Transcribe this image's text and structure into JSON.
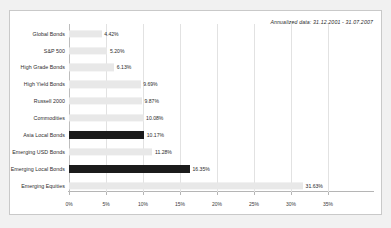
{
  "annotation": "Annualized data: 31.12.2001 - 31.07.2007",
  "colors": {
    "bar_default": "#e8e8e8",
    "bar_highlight": "#1b1b1b",
    "panel_background": "#ffffff",
    "page_background": "#f1f1f1",
    "text": "#2b2b2b",
    "gridline": "#e2e2e2"
  },
  "chart_data": {
    "type": "bar",
    "orientation": "horizontal",
    "title": "",
    "subtitle": "",
    "xlabel": "",
    "ylabel": "",
    "xlim": [
      0,
      35
    ],
    "grid": true,
    "legend": "none",
    "xticks": [
      0,
      5,
      10,
      15,
      20,
      25,
      30,
      35
    ],
    "xtick_labels": [
      "0%",
      "5%",
      "10%",
      "15%",
      "20%",
      "25%",
      "30%",
      "35%"
    ],
    "categories": [
      "Global Bonds",
      "S&P 500",
      "High Grade Bonds",
      "High Yield Bonds",
      "Russell 2000",
      "Commodities",
      "Asia Local Bonds",
      "Emerging USD Bonds",
      "Emerging Local Bonds",
      "Emerging Equities"
    ],
    "values": [
      4.42,
      5.2,
      6.13,
      9.69,
      9.87,
      10.08,
      10.17,
      11.28,
      16.35,
      31.63
    ],
    "value_labels": [
      "4.42%",
      "5.20%",
      "6.13%",
      "9.69%",
      "9.87%",
      "10.08%",
      "10.17%",
      "11.28%",
      "16.35%",
      "31.63%"
    ],
    "highlighted": [
      false,
      false,
      false,
      false,
      false,
      false,
      true,
      false,
      true,
      false
    ],
    "annotations": [
      "Annualized data: 31.12.2001 - 31.07.2007"
    ]
  }
}
